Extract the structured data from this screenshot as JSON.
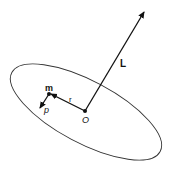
{
  "diagram": {
    "labels": {
      "angular_momentum": "L",
      "mass": "m",
      "position": "r",
      "momentum": "p",
      "origin": "O"
    },
    "colors": {
      "stroke": "#111111",
      "ellipse": "#333333",
      "background": "#ffffff"
    }
  }
}
